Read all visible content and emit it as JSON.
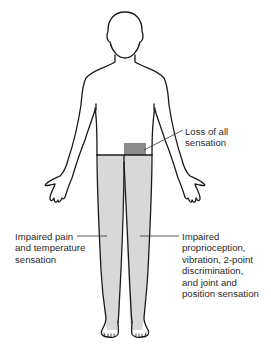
{
  "figure": {
    "type": "anatomical-body-outline",
    "view": "anterior",
    "colors": {
      "outline": "#1a1a1a",
      "impaired_region": "#d8d8d8",
      "total_loss_region": "#8a8a8a",
      "background": "#ffffff"
    }
  },
  "annotations": {
    "total_loss": {
      "text": "Loss of all\nsensation"
    },
    "left_side": {
      "text": "Impaired pain\nand temperature\nsensation"
    },
    "right_side": {
      "text": "Impaired\nproprioception,\nvibration, 2-point\ndiscrimination,\nand joint and\nposition sensation"
    }
  }
}
